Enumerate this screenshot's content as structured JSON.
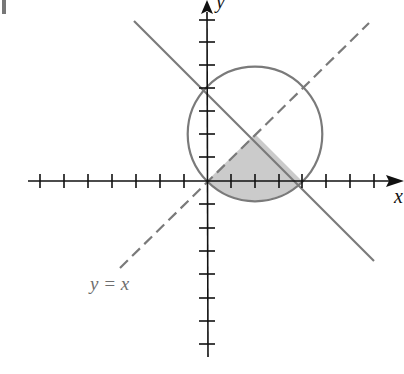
{
  "figure": {
    "type": "coordinate-plane",
    "x_axis_label": "x",
    "y_axis_label": "y",
    "curve_label": "y = x",
    "colors": {
      "axes": "#111111",
      "curves": "#7a7a7a",
      "shade": "#c8c8c8",
      "label": "#6e6e6e"
    },
    "elements": [
      {
        "name": "circle",
        "center": [
          2,
          2
        ],
        "radius": 2.83
      },
      {
        "name": "line",
        "equation": "x + y = 4"
      },
      {
        "name": "dashed-line",
        "equation": "y = x"
      },
      {
        "name": "shaded-region",
        "description": "region inside circle, below y = x, below x + y = 4"
      }
    ],
    "x_ticks": [
      -7,
      -6,
      -5,
      -4,
      -3,
      -2,
      -1,
      1,
      2,
      3,
      4,
      5,
      6,
      7
    ],
    "y_ticks": [
      -7,
      -6,
      -5,
      -4,
      -3,
      -2,
      -1,
      1,
      2,
      3,
      4,
      5,
      6,
      7
    ]
  }
}
